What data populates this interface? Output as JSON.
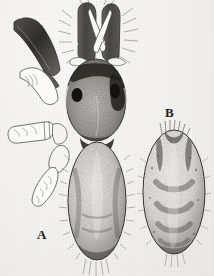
{
  "plate": {
    "kind": "scientific-illustration",
    "subject": "spider (dorsal view and isolated abdomen)",
    "medium": "scanned halftone / stipple line drawing",
    "background_color": "#f7f6f4",
    "ink_color": "#2a2a2a",
    "width": 214,
    "height": 276
  },
  "labels": {
    "figure_a": "A",
    "figure_b": "B"
  },
  "figures": [
    {
      "id": "figure-a",
      "label": "A",
      "label_position": {
        "x": 37,
        "y": 228
      },
      "description": "Complete spider in dorsal view, legs on left side, pedipalps raised above carapace",
      "parts": [
        {
          "name": "left-pedipalp",
          "shade": "dark",
          "x": 76,
          "y": 8,
          "w": 18,
          "h": 52
        },
        {
          "name": "right-pedipalp",
          "shade": "dark",
          "x": 100,
          "y": 8,
          "w": 18,
          "h": 52
        },
        {
          "name": "fangs",
          "shade": "light-outline",
          "x": 88,
          "y": 10,
          "w": 18,
          "h": 40
        },
        {
          "name": "carapace",
          "shade": "stipple",
          "x": 66,
          "y": 58,
          "w": 60,
          "h": 82
        },
        {
          "name": "left-eye",
          "shade": "black",
          "x": 72,
          "y": 88,
          "w": 10,
          "h": 13
        },
        {
          "name": "right-eye",
          "shade": "black",
          "x": 110,
          "y": 84,
          "w": 10,
          "h": 14
        },
        {
          "name": "abdomen",
          "shade": "stipple",
          "x": 68,
          "y": 142,
          "w": 58,
          "h": 118
        },
        {
          "name": "leg-1-dark",
          "shade": "dark",
          "x": 12,
          "y": 16,
          "w": 44,
          "h": 58
        },
        {
          "name": "leg-2-outline",
          "shade": "light-outline",
          "x": 16,
          "y": 68,
          "w": 40,
          "h": 42
        },
        {
          "name": "leg-3-outline",
          "shade": "light-outline",
          "x": 5,
          "y": 125,
          "w": 58,
          "h": 26
        },
        {
          "name": "leg-4-outline",
          "shade": "light-outline",
          "x": 30,
          "y": 148,
          "w": 36,
          "h": 58
        },
        {
          "name": "spinneret-hairs",
          "shade": "fine-lines",
          "x": 84,
          "y": 256,
          "w": 24,
          "h": 18
        }
      ]
    },
    {
      "id": "figure-b",
      "label": "B",
      "label_position": {
        "x": 165,
        "y": 106
      },
      "description": "Isolated oval abdomen in dorsal view with paired chevron markings",
      "parts": [
        {
          "name": "abdomen-outline",
          "shade": "stipple",
          "x": 143,
          "y": 130,
          "w": 62,
          "h": 124
        },
        {
          "name": "anterior-hair-tuft",
          "shade": "fine-lines",
          "x": 161,
          "y": 124,
          "w": 24,
          "h": 10
        },
        {
          "name": "chevron-marking-1",
          "shade": "dark-stipple",
          "x": 158,
          "y": 180,
          "w": 34,
          "h": 14
        },
        {
          "name": "chevron-marking-2",
          "shade": "dark-stipple",
          "x": 158,
          "y": 202,
          "w": 34,
          "h": 14
        },
        {
          "name": "chevron-marking-3",
          "shade": "dark-stipple",
          "x": 158,
          "y": 222,
          "w": 34,
          "h": 14
        },
        {
          "name": "posterior-hairs",
          "shade": "fine-lines",
          "x": 166,
          "y": 250,
          "w": 16,
          "h": 14
        }
      ]
    }
  ]
}
